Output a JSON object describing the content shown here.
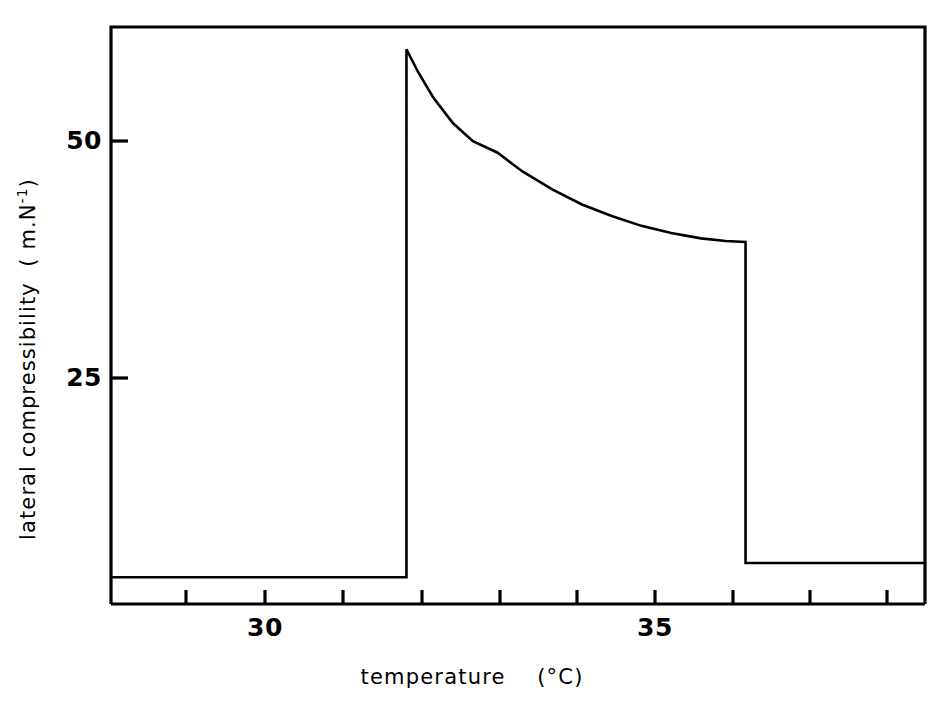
{
  "chart_data": {
    "type": "line",
    "title": "",
    "xlabel": "temperature    (°C)",
    "ylabel": "lateral compressibility  ( m.N⁻¹)",
    "ylabel_base": "lateral compressibility  ( m.N",
    "ylabel_exponent": "-1",
    "ylabel_tail": ")",
    "xlabel_main": "temperature",
    "xlabel_units": "(°C)",
    "xlim": [
      28.25,
      36.46
    ],
    "ylim": [
      -1.2,
      63.5
    ],
    "grid": false,
    "legend": null,
    "line_color": "#000000",
    "frame_color": "#000000",
    "background_color": "#ffffff",
    "x_ticks": [
      28.5,
      29.5,
      30.0,
      31.0,
      32.0,
      33.0,
      34.0,
      35.0,
      36.0
    ],
    "x_tick_positions": [
      28.5,
      29.5,
      30.5,
      31.5,
      32.0,
      33.0,
      34.0,
      35.0,
      36.0
    ],
    "x_tick_labels": [
      {
        "value": 30,
        "label": "30"
      },
      {
        "value": 35,
        "label": "35"
      }
    ],
    "y_tick_labels": [
      {
        "value": 50,
        "label": "50"
      },
      {
        "value": 25,
        "label": "25"
      }
    ],
    "series": [
      {
        "name": "lateral compressibility",
        "x": [
          28.25,
          29.0,
          30.0,
          31.0,
          31.23,
          31.23,
          31.35,
          31.5,
          31.7,
          31.9,
          32.15,
          32.4,
          32.7,
          33.0,
          33.3,
          33.6,
          33.9,
          34.2,
          34.45,
          34.65,
          34.65,
          34.65,
          35.2,
          36.0,
          36.46
        ],
        "y": [
          1.8,
          1.8,
          1.8,
          1.8,
          1.8,
          61.0,
          58.4,
          55.6,
          52.7,
          50.7,
          49.4,
          47.3,
          45.3,
          43.6,
          42.3,
          41.2,
          40.4,
          39.8,
          39.5,
          39.4,
          39.4,
          3.4,
          3.4,
          3.4,
          3.4
        ]
      }
    ],
    "annotations": []
  },
  "axis_titles": {
    "x": "temperature",
    "x_units": "(°C)",
    "y_prefix": "lateral compressibility  ( m.N",
    "y_superscript": "-1",
    "y_suffix": ")"
  },
  "tick_text": {
    "y_50": "50",
    "y_25": "25",
    "x_30": "30",
    "x_35": "35"
  }
}
